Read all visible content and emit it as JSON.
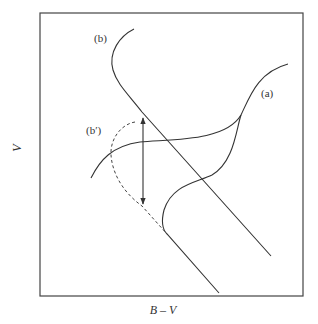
{
  "diagram": {
    "type": "color-magnitude sketch",
    "axes": {
      "xlabel": "B – V",
      "ylabel": "V"
    },
    "curves": [
      {
        "id": "a",
        "label": "(a)",
        "style": "solid"
      },
      {
        "id": "b",
        "label": "(b)",
        "style": "solid"
      },
      {
        "id": "b_prime",
        "label": "(b′)",
        "style": "dashed"
      }
    ],
    "annotations": [
      {
        "type": "double-arrow",
        "orientation": "vertical"
      }
    ],
    "colors": {
      "ink": "#333333",
      "background": "#ffffff"
    }
  }
}
